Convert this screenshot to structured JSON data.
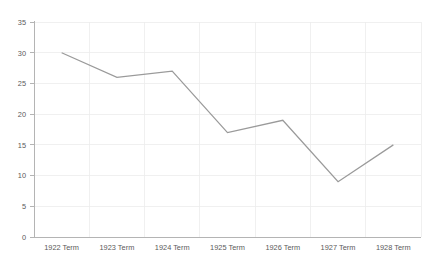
{
  "chart_data": {
    "type": "line",
    "title": "",
    "subtitle": "",
    "xlabel": "",
    "ylabel": "",
    "categories": [
      "1922 Term",
      "1923 Term",
      "1924 Term",
      "1925 Term",
      "1926 Term",
      "1927 Term",
      "1928 Term"
    ],
    "series": [
      {
        "name": "",
        "values": [
          30,
          26,
          27,
          17,
          19,
          9,
          15
        ],
        "color": "#9a9a9a"
      }
    ],
    "ylim": [
      0,
      35
    ],
    "yticks": [
      0,
      5,
      10,
      15,
      20,
      25,
      30,
      35
    ],
    "ytick_labels": [
      "0",
      "5",
      "10",
      "15",
      "20",
      "25",
      "30",
      "35"
    ],
    "xtick_labels": [
      "1922 Term",
      "1923 Term",
      "1924 Term",
      "1925 Term",
      "1926 Term",
      "1927 Term",
      "1928 Term"
    ],
    "grid": true,
    "grid_axis": "both",
    "grid_color": "#ececec",
    "axis_color": "#b4b4b4",
    "legend": false,
    "legend_position": "none",
    "markers": false,
    "background": "#ffffff"
  },
  "axes": {
    "y_label_0": "0",
    "y_label_1": "5",
    "y_label_2": "10",
    "y_label_3": "15",
    "y_label_4": "20",
    "y_label_5": "25",
    "y_label_6": "30",
    "y_label_7": "35",
    "x_label_0": "1922 Term",
    "x_label_1": "1923 Term",
    "x_label_2": "1924 Term",
    "x_label_3": "1925 Term",
    "x_label_4": "1926 Term",
    "x_label_5": "1927 Term",
    "x_label_6": "1928 Term"
  }
}
